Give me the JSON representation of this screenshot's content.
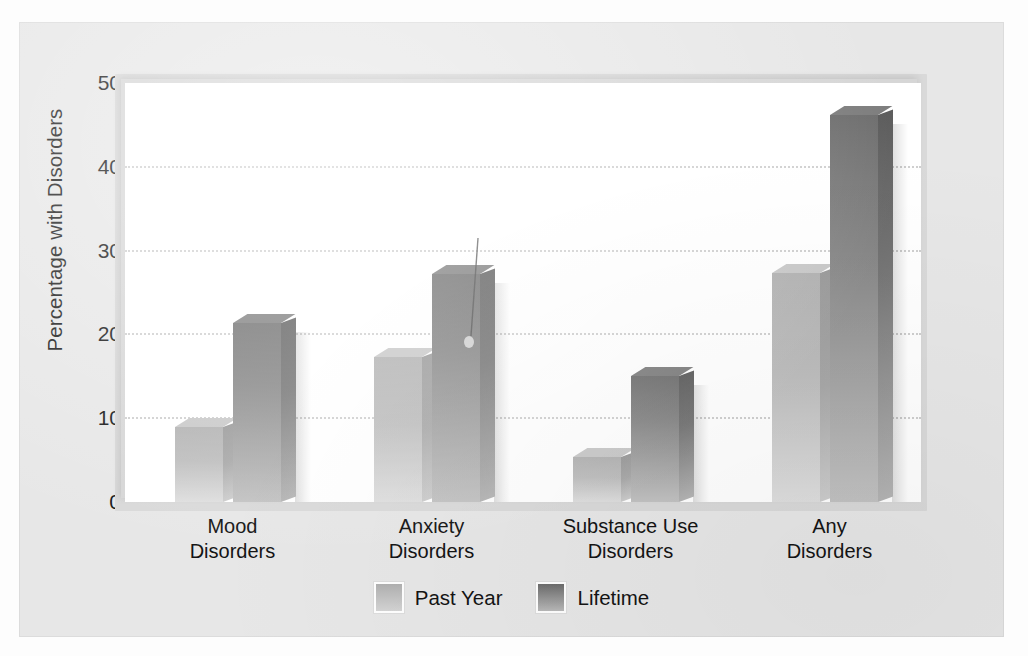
{
  "figure": {
    "background_color": "#e7e7e7",
    "plot_background_color": "#ffffff",
    "gridline_color": "#cfcfcf"
  },
  "chart_data": {
    "type": "bar",
    "title": "",
    "xlabel": "",
    "ylabel": "Percentage with Disorders",
    "ylim": [
      0,
      50
    ],
    "yticks": [
      0,
      10,
      20,
      30,
      40,
      50
    ],
    "ytick_labels": [
      "0",
      "10",
      "20",
      "30",
      "40",
      "50"
    ],
    "grid": true,
    "grid_style": "dotted horizontal",
    "legend_position": "bottom-center",
    "categories": [
      "Mood\nDisorders",
      "Anxiety\nDisorders",
      "Substance Use\nDisorders",
      "Any\nDisorders"
    ],
    "category_lines": [
      [
        "Mood",
        "Disorders"
      ],
      [
        "Anxiety",
        "Disorders"
      ],
      [
        "Substance Use",
        "Disorders"
      ],
      [
        "Any",
        "Disorders"
      ]
    ],
    "series": [
      {
        "name": "Past Year",
        "color": "#bdbdbd",
        "values": [
          9.0,
          17.3,
          5.4,
          27.3
        ]
      },
      {
        "name": "Lifetime",
        "color": "#7d7d7d",
        "values": [
          21.4,
          27.2,
          15.0,
          46.2
        ]
      }
    ]
  },
  "legend": {
    "entries": [
      {
        "label": "Past Year",
        "swatch": "past"
      },
      {
        "label": "Lifetime",
        "swatch": "life"
      }
    ]
  }
}
